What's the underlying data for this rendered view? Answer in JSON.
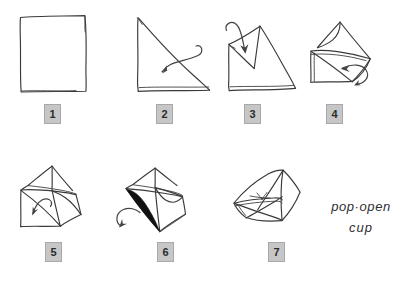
{
  "diagram": {
    "style": "hand-drawn pen sketch",
    "background_color": "#ffffff",
    "ink_color": "#3a3a3c",
    "badge_fill_color": "#c6c6c6",
    "badge_border_color": "#a8a8a8",
    "badge_text_color": "#2b2b2b",
    "shade_color": "#111113"
  },
  "caption": {
    "line1": "pop·open",
    "line2": "cup"
  },
  "steps": [
    {
      "number": "1",
      "badge_label": "1",
      "description": "Flat square sheet of paper",
      "has_arrow": false,
      "has_shading": false
    },
    {
      "number": "2",
      "badge_label": "2",
      "description": "Square folded in half diagonally into a triangle, curved arrow looping down-left",
      "has_arrow": true,
      "arrow_direction": "down-left-loop",
      "has_shading": false
    },
    {
      "number": "3",
      "badge_label": "3",
      "description": "Triangle with top corner folded down, curved arrow pointing down",
      "has_arrow": true,
      "arrow_direction": "down",
      "has_shading": false
    },
    {
      "number": "4",
      "badge_label": "4",
      "description": "Side corner folded across, curved arrow looping right",
      "has_arrow": true,
      "arrow_direction": "right-loop",
      "has_shading": false
    },
    {
      "number": "5",
      "badge_label": "5",
      "description": "Opposite corner folded across, small curved arrow pointing left",
      "has_arrow": true,
      "arrow_direction": "left",
      "has_shading": false
    },
    {
      "number": "6",
      "badge_label": "6",
      "description": "Flap tucked with shaded pocket, curved arrow pointing up-left",
      "has_arrow": true,
      "arrow_direction": "up-left",
      "has_shading": true
    },
    {
      "number": "7",
      "badge_label": "7",
      "description": "Finished pop-open cup opened out",
      "has_arrow": false,
      "has_shading": false
    }
  ]
}
